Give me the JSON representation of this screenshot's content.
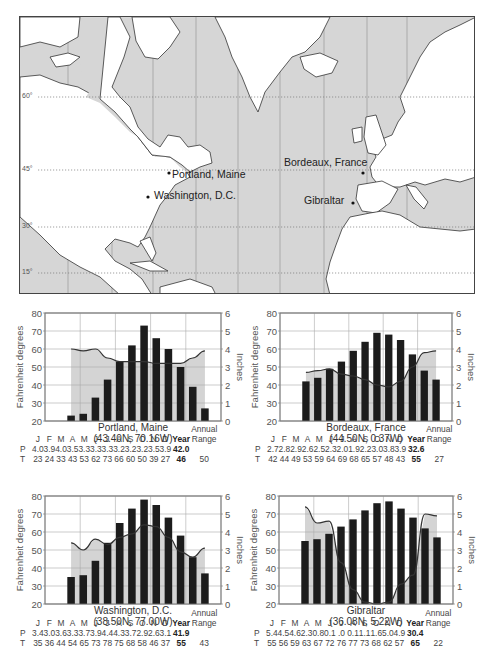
{
  "map": {
    "labels": [
      {
        "text": "Portland, Maine",
        "x": 171,
        "y": 174
      },
      {
        "text": "Washington, D.C.",
        "x": 153,
        "y": 195
      },
      {
        "text": "Bordeaux,  France",
        "x": 283,
        "y": 162
      },
      {
        "text": "Gibraltar",
        "x": 303,
        "y": 200
      }
    ],
    "latitudes": [
      {
        "label": "60°",
        "y": 96
      },
      {
        "label": "45°",
        "y": 169
      },
      {
        "label": "30°",
        "y": 226
      },
      {
        "label": "15°",
        "y": 272
      }
    ],
    "colors": {
      "ocean": "#d6d6d6",
      "land": "#ffffff",
      "coast": "#333333"
    }
  },
  "chart_data": [
    {
      "type": "bar",
      "title": "Portland, Maine",
      "subtitle": "(43.40N, 70.16W)",
      "categories": [
        "J",
        "F",
        "M",
        "A",
        "M",
        "J",
        "J",
        "A",
        "S",
        "O",
        "N",
        "D"
      ],
      "series": [
        {
          "name": "Temperature (°F)",
          "type": "bar",
          "axis": "left",
          "values": [
            23,
            24,
            33,
            43,
            53,
            62,
            73,
            66,
            60,
            50,
            39,
            27
          ]
        },
        {
          "name": "Precipitation (in)",
          "type": "area",
          "axis": "right",
          "values": [
            4.0,
            3.9,
            4.0,
            3.5,
            3.3,
            3.3,
            3.3,
            3.2,
            3.2,
            3.2,
            3.5,
            3.9
          ]
        }
      ],
      "ylabel": "Fahrenheit degrees",
      "ylim": [
        20,
        80
      ],
      "yticks": [
        20,
        30,
        40,
        50,
        60,
        70,
        80
      ],
      "y2label": "Inches",
      "y2lim": [
        0,
        6
      ],
      "y2ticks": [
        0,
        1,
        2,
        3,
        4,
        5,
        6
      ],
      "year_P": "42.0",
      "year_T": "46",
      "annual_range": "50",
      "P_text": [
        "4.0",
        "3.9",
        "4.0",
        "3.5",
        "3.3",
        "3.3",
        "3.3",
        "3.2",
        "3.2",
        "3.2",
        "3.5",
        "3.9"
      ],
      "T_text": [
        "23",
        "24",
        "33",
        "43",
        "53",
        "62",
        "73",
        "66",
        "60",
        "50",
        "39",
        "27"
      ]
    },
    {
      "type": "bar",
      "title": "Bordeaux, France",
      "subtitle": "(44.50N, 0.37W)",
      "categories": [
        "J",
        "F",
        "M",
        "A",
        "M",
        "J",
        "J",
        "A",
        "S",
        "O",
        "N",
        "D"
      ],
      "series": [
        {
          "name": "Temperature (°F)",
          "type": "bar",
          "axis": "left",
          "values": [
            42,
            44,
            49,
            53,
            59,
            64,
            69,
            68,
            65,
            57,
            48,
            43
          ]
        },
        {
          "name": "Precipitation (in)",
          "type": "area",
          "axis": "right",
          "values": [
            2.7,
            2.8,
            2.9,
            2.6,
            2.5,
            2.3,
            2.0,
            1.9,
            2.2,
            3.0,
            3.8,
            3.9
          ]
        }
      ],
      "ylabel": "Fahrenheit degrees",
      "ylim": [
        20,
        80
      ],
      "yticks": [
        20,
        30,
        40,
        50,
        60,
        70,
        80
      ],
      "y2label": "Inches",
      "y2lim": [
        0,
        6
      ],
      "y2ticks": [
        0,
        1,
        2,
        3,
        4,
        5,
        6
      ],
      "year_P": "32.6",
      "year_T": "55",
      "annual_range": "27",
      "P_text": [
        "2.7",
        "2.8",
        "2.9",
        "2.6",
        "2.5",
        "2.3",
        "2.0",
        "1.9",
        "2.2",
        "3.0",
        "3.8",
        "3.9"
      ],
      "T_text": [
        "42",
        "44",
        "49",
        "53",
        "59",
        "64",
        "69",
        "68",
        "65",
        "57",
        "48",
        "43"
      ]
    },
    {
      "type": "bar",
      "title": "Washington, D.C.",
      "subtitle": "(38.50N, 77.00W)",
      "categories": [
        "J",
        "F",
        "M",
        "A",
        "M",
        "J",
        "J",
        "A",
        "S",
        "O",
        "N",
        "D"
      ],
      "series": [
        {
          "name": "Temperature (°F)",
          "type": "bar",
          "axis": "left",
          "values": [
            35,
            36,
            44,
            54,
            65,
            73,
            78,
            75,
            68,
            58,
            46,
            37
          ]
        },
        {
          "name": "Precipitation (in)",
          "type": "area",
          "axis": "right",
          "values": [
            3.4,
            3.0,
            3.6,
            3.3,
            3.7,
            3.9,
            4.4,
            4.3,
            3.7,
            2.9,
            2.6,
            3.1
          ]
        }
      ],
      "ylabel": "Fahrenheit degrees",
      "ylim": [
        20,
        80
      ],
      "yticks": [
        20,
        30,
        40,
        50,
        60,
        70,
        80
      ],
      "y2label": "Inches",
      "y2lim": [
        0,
        6
      ],
      "y2ticks": [
        0,
        1,
        2,
        3,
        4,
        5,
        6
      ],
      "year_P": "41.9",
      "year_T": "55",
      "annual_range": "43",
      "P_text": [
        "3.4",
        "3.0",
        "3.6",
        "3.3",
        "3.7",
        "3.9",
        "4.4",
        "4.3",
        "3.7",
        "2.9",
        "2.6",
        "3.1"
      ],
      "T_text": [
        "35",
        "36",
        "44",
        "54",
        "65",
        "73",
        "78",
        "75",
        "68",
        "58",
        "46",
        "37"
      ]
    },
    {
      "type": "bar",
      "title": "Gibraltar",
      "subtitle": "(36.08N, 5.22W)",
      "categories": [
        "J",
        "F",
        "M",
        "A",
        "M",
        "J",
        "J",
        "A",
        "S",
        "O",
        "N",
        "D"
      ],
      "series": [
        {
          "name": "Temperature (°F)",
          "type": "bar",
          "axis": "left",
          "values": [
            55,
            56,
            59,
            63,
            67,
            72,
            76,
            77,
            73,
            68,
            62,
            57
          ]
        },
        {
          "name": "Precipitation (in)",
          "type": "area",
          "axis": "right",
          "values": [
            5.4,
            4.5,
            4.6,
            2.3,
            0.8,
            0.1,
            0.0,
            0.1,
            1.1,
            1.6,
            5.0,
            4.9
          ]
        }
      ],
      "ylabel": "Fahrenheit degrees",
      "ylim": [
        20,
        80
      ],
      "yticks": [
        20,
        30,
        40,
        50,
        60,
        70,
        80
      ],
      "y2label": "Inches",
      "y2lim": [
        0,
        6
      ],
      "y2ticks": [
        0,
        1,
        2,
        3,
        4,
        5,
        6
      ],
      "year_P": "30.4",
      "year_T": "65",
      "annual_range": "22",
      "P_text": [
        "5.4",
        "4.5",
        "4.6",
        "2.3",
        "0.8",
        "0.1",
        ".0",
        "0.1",
        "1.1",
        "1.6",
        "5.0",
        "4.9"
      ],
      "T_text": [
        "55",
        "56",
        "59",
        "63",
        "67",
        "72",
        "76",
        "77",
        "73",
        "68",
        "62",
        "57"
      ]
    }
  ],
  "table_labels": {
    "P": "P",
    "T": "T",
    "year": "Year",
    "annual": "Annual",
    "range": "Range"
  },
  "layout": {
    "charts": [
      {
        "plot_x": 45,
        "plot_y": 313,
        "plot_w": 176,
        "plot_h": 108,
        "table_y": 444
      },
      {
        "plot_x": 280,
        "plot_y": 313,
        "plot_w": 172,
        "plot_h": 108,
        "table_y": 444
      },
      {
        "plot_x": 45,
        "plot_y": 496,
        "plot_w": 176,
        "plot_h": 108,
        "table_y": 628
      },
      {
        "plot_x": 279,
        "plot_y": 496,
        "plot_w": 174,
        "plot_h": 108,
        "table_y": 628
      }
    ]
  }
}
